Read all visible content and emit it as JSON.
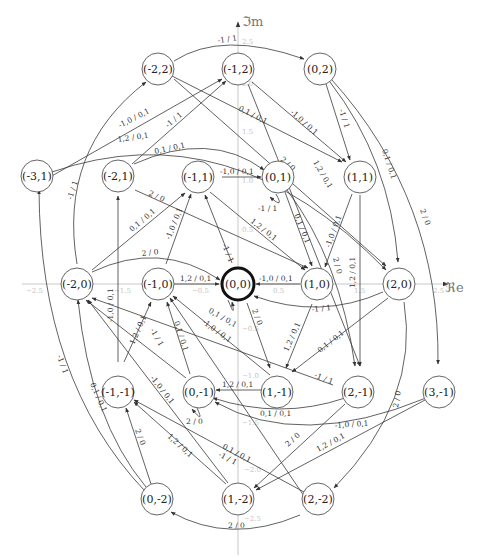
{
  "diagram": {
    "axes": {
      "x_label": "ℜe",
      "y_label": "ℑm",
      "x_ticks": [
        "−2.5",
        "−2.0",
        "−1.5",
        "−1.0",
        "−0.5",
        "0.5",
        "1.0",
        "1.5",
        "2.0",
        "2.5"
      ],
      "y_ticks": [
        "2.5",
        "2.0",
        "1.5",
        "1.0",
        "0.5",
        "−0.5",
        "−1.0",
        "−1.5",
        "−2.0",
        "−2.5"
      ]
    },
    "nodes": [
      {
        "id": "-2,2",
        "label": "(-2,2)"
      },
      {
        "id": "-1,2",
        "label": "(-1,2)"
      },
      {
        "id": "0,2",
        "label": "(0,2)"
      },
      {
        "id": "-3,1",
        "label": "(-3,1)"
      },
      {
        "id": "-2,1",
        "label": "(-2,1)"
      },
      {
        "id": "-1,1",
        "label": "(-1,1)"
      },
      {
        "id": "0,1",
        "label": "(0,1)"
      },
      {
        "id": "1,1",
        "label": "(1,1)"
      },
      {
        "id": "-2,0",
        "label": "(-2,0)"
      },
      {
        "id": "-1,0",
        "label": "(-1,0)"
      },
      {
        "id": "0,0",
        "label": "(0,0)",
        "initial": true
      },
      {
        "id": "1,0",
        "label": "(1,0)"
      },
      {
        "id": "2,0",
        "label": "(2,0)"
      },
      {
        "id": "-1,-1",
        "label": "(-1,-1)"
      },
      {
        "id": "0,-1",
        "label": "(0,-1)"
      },
      {
        "id": "1,-1",
        "label": "(1,-1)"
      },
      {
        "id": "2,-1",
        "label": "(2,-1)"
      },
      {
        "id": "3,-1",
        "label": "(3,-1)"
      },
      {
        "id": "0,-2",
        "label": "(0,-2)"
      },
      {
        "id": "1,-2",
        "label": "(1,-2)"
      },
      {
        "id": "2,-2",
        "label": "(2,-2)"
      }
    ],
    "edges": [
      {
        "from": "-1,2",
        "to": "0,2",
        "label": "-1 / 1"
      },
      {
        "from": "-2,0",
        "to": "-2,2",
        "label": "-1 / 1"
      },
      {
        "from": "-3,1",
        "to": "-1,2",
        "label": "-1,0 / 0,1"
      },
      {
        "from": "-2,1",
        "to": "-1,2",
        "label": "-1 / 1"
      },
      {
        "from": "-3,1",
        "to": "2,0",
        "label": "1,2 / 0,1"
      },
      {
        "from": "-2,1",
        "to": "0,1",
        "label": "0,1 / 0,1"
      },
      {
        "from": "-2,1",
        "to": "1,0",
        "label": "2 / 0"
      },
      {
        "from": "-2,2",
        "to": "1,1",
        "label": "0,1 / 0,1"
      },
      {
        "from": "-2,2",
        "to": "2,0",
        "label": "2 / 0"
      },
      {
        "from": "-1,2",
        "to": "1,1",
        "label": "-1,0 / 0,1"
      },
      {
        "from": "-1,2",
        "to": "1,-1",
        "label": "1,2 / 0,1"
      },
      {
        "from": "0,2",
        "to": "1,1",
        "label": "-1 / 1"
      },
      {
        "from": "0,2",
        "to": "2,0",
        "label": "0,1 / 0,1"
      },
      {
        "from": "0,2",
        "to": "3,-1",
        "label": "2 / 0"
      },
      {
        "from": "-1,1",
        "to": "0,1",
        "label": "-1,0 / 0,1"
      },
      {
        "from": "0,1",
        "to": "0,1",
        "label": "-1 / 1"
      },
      {
        "from": "-1,1",
        "to": "1,0",
        "label": "1,2 / 0,1"
      },
      {
        "from": "0,1",
        "to": "1,0",
        "label": "0,1 / 0,1"
      },
      {
        "from": "0,1",
        "to": "2,-1",
        "label": "2 / 0"
      },
      {
        "from": "1,1",
        "to": "1,0",
        "label": "-1,0 / 0,1"
      },
      {
        "from": "1,1",
        "to": "2,-1",
        "label": "1,2 / 0,1"
      },
      {
        "from": "-2,0",
        "to": "-1,1",
        "label": "0,1 / 0,1"
      },
      {
        "from": "-1,0",
        "to": "-1,1",
        "label": "-1,0 / 0,1"
      },
      {
        "from": "0,0",
        "to": "-1,1",
        "label": "-1 / 1"
      },
      {
        "from": "-2,0",
        "to": "0,0",
        "label": "2 / 0"
      },
      {
        "from": "-1,0",
        "to": "0,0",
        "label": "1,2 / 0,1"
      },
      {
        "from": "1,0",
        "to": "0,0",
        "label": "-1,0 / 0,1"
      },
      {
        "from": "2,0",
        "to": "0,0",
        "label": "-1 / 1"
      },
      {
        "from": "0,0",
        "to": "0,0",
        "label": "0,1 / 0,1"
      },
      {
        "from": "0,0",
        "to": "1,-1",
        "label": "2 / 0"
      },
      {
        "from": "1,0",
        "to": "1,-1",
        "label": "1,2 / 0,1"
      },
      {
        "from": "2,0",
        "to": "1,-1",
        "label": "0,1 / 0,1"
      },
      {
        "from": "2,0",
        "to": "2,-2",
        "label": "2 / 0"
      },
      {
        "from": "-1,-1",
        "to": "-2,1",
        "label": "-1,0 / 0,1"
      },
      {
        "from": "-1,-1",
        "to": "-1,0",
        "label": "1,2 / 0,1"
      },
      {
        "from": "0,-1",
        "to": "-1,0",
        "label": "0,1 / 0,1"
      },
      {
        "from": "0,-1",
        "to": "-2,0",
        "label": "-1 / 1"
      },
      {
        "from": "1,-1",
        "to": "-1,0",
        "label": "-1,0 / 0,1"
      },
      {
        "from": "2,-1",
        "to": "-2,0",
        "label": "-1 / 1"
      },
      {
        "from": "1,-1",
        "to": "0,-1",
        "label": "1,2 / 0,1"
      },
      {
        "from": "0,-1",
        "to": "0,-1",
        "label": "2 / 0"
      },
      {
        "from": "2,-1",
        "to": "0,-1",
        "label": "0,1 / 0,1"
      },
      {
        "from": "3,-1",
        "to": "0,-1",
        "label": "-1,0 / 0,1"
      },
      {
        "from": "2,-1",
        "to": "1,-2",
        "label": "2 / 0"
      },
      {
        "from": "3,-1",
        "to": "1,-2",
        "label": "1,2 / 0,1"
      },
      {
        "from": "0,-2",
        "to": "-1,-1",
        "label": "2 / 0"
      },
      {
        "from": "0,-2",
        "to": "-2,0",
        "label": "0,1 / 0,1"
      },
      {
        "from": "0,-2",
        "to": "-3,1",
        "label": "-1 / 1"
      },
      {
        "from": "1,-2",
        "to": "-1,-1",
        "label": "1,2 / 0,1"
      },
      {
        "from": "1,-2",
        "to": "-2,0",
        "label": "-1,0 / 0,1"
      },
      {
        "from": "2,-2",
        "to": "-1,-1",
        "label": "0,1 / 0,1"
      },
      {
        "from": "2,-2",
        "to": "-1,0",
        "label": "-1 / 1"
      },
      {
        "from": "2,-2",
        "to": "0,-2",
        "label": "2 / 0"
      }
    ]
  }
}
